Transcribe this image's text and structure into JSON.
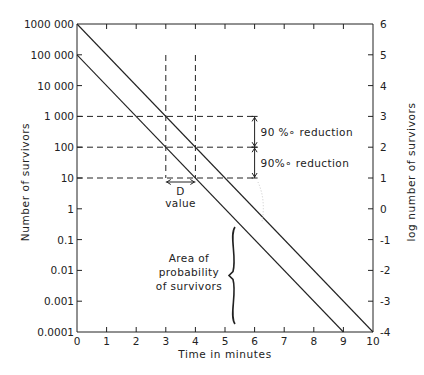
{
  "chart_data": {
    "type": "line",
    "title": "",
    "xlabel": "Time in minutes",
    "ylabel_left": "Number of survivors",
    "ylabel_right": "log number of survivors",
    "xlim": [
      0,
      10
    ],
    "ylim_log10": [
      -4,
      6
    ],
    "grid": false,
    "x_ticks": [
      "0",
      "1",
      "2",
      "3",
      "4",
      "5",
      "6",
      "7",
      "8",
      "9",
      "10"
    ],
    "y_left_ticks": [
      "1000 000",
      "100 000",
      "10 000",
      "1 000",
      "100",
      "10",
      "1",
      "0.1",
      "0.01",
      "0.001",
      "0.0001"
    ],
    "y_right_ticks": [
      "6",
      "5",
      "4",
      "3",
      "2",
      "1",
      "0",
      "-1",
      "-2",
      "-3",
      "-4"
    ],
    "series": [
      {
        "name": "Upper survivor curve",
        "x": [
          0,
          10
        ],
        "y": [
          1000000,
          0.0001
        ],
        "log_y": [
          6,
          -4
        ]
      },
      {
        "name": "Lower survivor curve",
        "x": [
          0,
          9
        ],
        "y": [
          100000,
          0.0001
        ],
        "log_y": [
          5,
          -4
        ]
      }
    ],
    "annotations": [
      {
        "text": "90 % reduction",
        "from_log": 3,
        "to_log": 2,
        "at_x": 6
      },
      {
        "text": "90% reduction",
        "from_log": 2,
        "to_log": 1,
        "at_x": 6
      },
      {
        "text": "D value",
        "from_x": 3,
        "to_x": 4,
        "at_log": 1
      },
      {
        "text": "Area of probability of survivors",
        "log_range": [
          -4,
          -1
        ],
        "at_x": 4.5
      }
    ],
    "dashed_guides": {
      "horizontal_log": [
        3,
        2,
        1
      ],
      "vertical_x": [
        3,
        4
      ]
    }
  },
  "labels": {
    "xlabel": "Time in minutes",
    "ylabel_left": "Number of survivors",
    "ylabel_right": "log number of survivors",
    "reduction_1": "90 %∘ reduction",
    "reduction_2": "90%∘ reduction",
    "d_value_line1": "D",
    "d_value_line2": "value",
    "area_line1": "Area of",
    "area_line2": "probability",
    "area_line3": "of survivors"
  },
  "colors": {
    "ink": "#222222",
    "background": "#ffffff",
    "faint": "#c8c8c8"
  }
}
